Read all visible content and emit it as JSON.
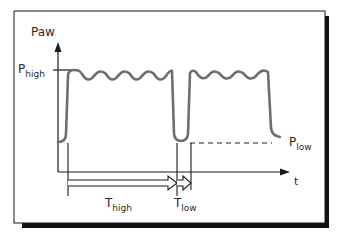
{
  "diagram": {
    "y_axis_label": "Paw",
    "x_axis_label": "t",
    "p_high": {
      "base": "P",
      "sub": "high"
    },
    "p_low": {
      "base": "P",
      "sub": "low"
    },
    "t_high": {
      "base": "T",
      "sub": "high"
    },
    "t_low": {
      "base": "T",
      "sub": "low"
    },
    "colors": {
      "trace": "#6e6e6e",
      "axis": "#1a1a1a",
      "frame": "#1a1a1a",
      "shadow": "#111111"
    }
  }
}
